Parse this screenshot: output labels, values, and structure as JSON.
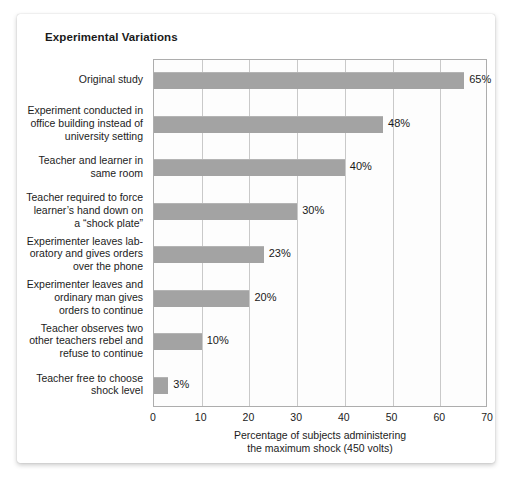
{
  "card": {
    "title": "Experimental Variations"
  },
  "chart_data": {
    "type": "bar",
    "orientation": "horizontal",
    "title": "Experimental Variations",
    "xlabel": "Percentage of subjects administering the maximum shock (450 volts)",
    "xlabel_line1": "Percentage of subjects administering",
    "xlabel_line2": "the maximum shock (450 volts)",
    "ylabel": "",
    "xlim": [
      0,
      70
    ],
    "xticks": [
      0,
      10,
      20,
      30,
      40,
      50,
      60,
      70
    ],
    "xtick_labels": [
      "0",
      "10",
      "20",
      "30",
      "40",
      "50",
      "60",
      "70"
    ],
    "grid": "vertical",
    "legend": "none",
    "bar_color": "#a3a3a3",
    "categories": [
      "Original study",
      "Experiment conducted in office building instead of university setting",
      "Teacher and learner in same room",
      "Teacher required to force learner’s hand down on a “shock plate”",
      "Experimenter leaves laboratory and gives orders over the phone",
      "Experimenter leaves and ordinary man gives orders to continue",
      "Teacher observes two other teachers rebel and refuse to continue",
      "Teacher free to choose shock level"
    ],
    "category_lines": [
      [
        "Original study"
      ],
      [
        "Experiment conducted in",
        "office building instead of",
        "university setting"
      ],
      [
        "Teacher and learner in",
        "same room"
      ],
      [
        "Teacher required to force",
        "learner’s hand down on",
        "a “shock plate”"
      ],
      [
        "Experimenter leaves lab-",
        "oratory and gives orders",
        "over the phone"
      ],
      [
        "Experimenter leaves and",
        "ordinary man gives",
        "orders to continue"
      ],
      [
        "Teacher observes two",
        "other teachers rebel and",
        "refuse to continue"
      ],
      [
        "Teacher free to choose",
        "shock level"
      ]
    ],
    "values": [
      65,
      48,
      40,
      30,
      23,
      20,
      10,
      3
    ],
    "value_labels": [
      "65%",
      "48%",
      "40%",
      "30%",
      "23%",
      "20%",
      "10%",
      "3%"
    ]
  }
}
